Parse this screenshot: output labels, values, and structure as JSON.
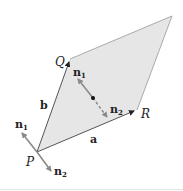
{
  "diagram": {
    "type": "parallelogram-with-normals",
    "colors": {
      "fill": "#e6e6e6",
      "edge": "#555555",
      "edge_light": "#aaaaaa",
      "normal_arrow": "#8a8a8a",
      "text": "#222222"
    },
    "vertices": {
      "P": {
        "label": "P"
      },
      "Q": {
        "label": "Q"
      },
      "R": {
        "label": "R"
      }
    },
    "edges": {
      "a": {
        "label": "a"
      },
      "b": {
        "label": "b"
      }
    },
    "center_normals": {
      "n1": {
        "base": "n",
        "sub": "1"
      },
      "n2": {
        "base": "n",
        "sub": "2"
      }
    },
    "vertex_normals": {
      "n1": {
        "base": "n",
        "sub": "1"
      },
      "n2": {
        "base": "n",
        "sub": "2"
      }
    }
  }
}
